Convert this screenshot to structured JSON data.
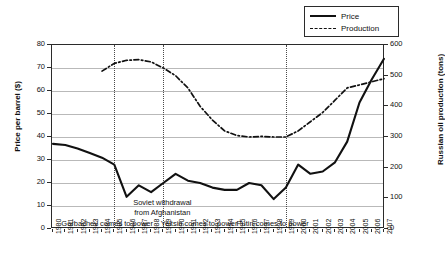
{
  "legend": {
    "position": "top-right",
    "entries": [
      {
        "label": "Price",
        "style": "solid",
        "key_icon": "solid-line-icon"
      },
      {
        "label": "Production",
        "style": "dash-dot",
        "key_icon": "dash-dot-line-icon"
      }
    ]
  },
  "axes": {
    "left": {
      "title": "Price per barrel ($)",
      "ticks": [
        0,
        10,
        20,
        30,
        40,
        50,
        60,
        70,
        80
      ],
      "min": 0,
      "max": 80
    },
    "right": {
      "title": "Russian oil production (tons)",
      "ticks": [
        0,
        100,
        200,
        300,
        400,
        500,
        600
      ],
      "min": 0,
      "max": 600
    },
    "bottom": {
      "title": "",
      "ticks": [
        "1980",
        "1981",
        "1982",
        "1983",
        "1984",
        "1985",
        "1986",
        "1987",
        "1988",
        "1989",
        "1990",
        "1991",
        "1992",
        "1993",
        "1994",
        "1995",
        "1996",
        "1997",
        "1998",
        "1999",
        "2000",
        "2001",
        "2002",
        "2003",
        "2004",
        "2005",
        "2006",
        "2007"
      ]
    }
  },
  "annotations": {
    "eras": [
      {
        "label": "Gorbachev comes to power",
        "at_year": 1985
      },
      {
        "label": "Yeltsin comes to power",
        "at_year": 1989
      },
      {
        "label": "Putin comes to power",
        "at_year": 1999
      }
    ],
    "events": [
      {
        "line1": "Soviet withdrawal",
        "line2": "from Afghanistan",
        "at_year": 1989
      }
    ],
    "dividers": [
      1985,
      1989,
      1999
    ]
  },
  "chart_data": {
    "type": "line",
    "title": "",
    "xlabel": "",
    "ylabel": "Price per barrel ($)",
    "y2label": "Russian oil production (tons)",
    "ylim": [
      0,
      80
    ],
    "y2lim": [
      0,
      600
    ],
    "grid": true,
    "legend_position": "top-right",
    "x": [
      1980,
      1981,
      1982,
      1983,
      1984,
      1985,
      1986,
      1987,
      1988,
      1989,
      1990,
      1991,
      1992,
      1993,
      1994,
      1995,
      1996,
      1997,
      1998,
      1999,
      2000,
      2001,
      2002,
      2003,
      2004,
      2005,
      2006,
      2007
    ],
    "series": [
      {
        "name": "Price",
        "axis": "left",
        "units": "$ per barrel",
        "style": "solid",
        "values": [
          37,
          36.5,
          35,
          33,
          31,
          28,
          14,
          19,
          16,
          20,
          24,
          21,
          20,
          18,
          17,
          17,
          20,
          19,
          13,
          18,
          28,
          24,
          25,
          29,
          38,
          55,
          65,
          74
        ]
      },
      {
        "name": "Production",
        "axis": "right",
        "units": "tons",
        "style": "dash-dot",
        "values": [
          null,
          null,
          null,
          null,
          515,
          540,
          550,
          552,
          545,
          525,
          500,
          460,
          400,
          355,
          320,
          305,
          300,
          302,
          300,
          300,
          320,
          350,
          380,
          420,
          460,
          470,
          480,
          490
        ]
      }
    ]
  }
}
